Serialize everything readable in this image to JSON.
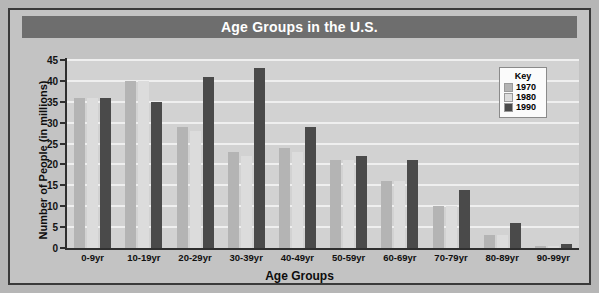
{
  "chart_data": {
    "type": "bar",
    "title": "Age Groups in the U.S.",
    "xlabel": "Age Groups",
    "ylabel": "Number of People (in millions)",
    "categories": [
      "0-9yr",
      "10-19yr",
      "20-29yr",
      "30-39yr",
      "40-49yr",
      "50-59yr",
      "60-69yr",
      "70-79yr",
      "80-89yr",
      "90-99yr"
    ],
    "series": [
      {
        "name": "1970",
        "color": "#b4b4b4",
        "values": [
          36,
          40,
          29,
          23,
          24,
          21,
          16,
          10,
          3,
          0.4
        ]
      },
      {
        "name": "1980",
        "color": "#dcdcdc",
        "values": [
          36,
          40,
          28,
          22,
          23,
          21,
          16,
          10,
          3,
          0.4
        ]
      },
      {
        "name": "1990",
        "color": "#4a4a4a",
        "values": [
          36,
          35,
          41,
          43,
          29,
          22,
          21,
          14,
          6,
          1
        ]
      }
    ],
    "ylim": [
      0,
      45
    ],
    "yticks": [
      0,
      5,
      10,
      15,
      20,
      25,
      30,
      35,
      40,
      45
    ],
    "grid": true,
    "legend": {
      "title": "Key",
      "position": "top-right"
    }
  },
  "legend": {
    "title": "Key",
    "entries": [
      {
        "label": "1970",
        "color": "#b4b4b4"
      },
      {
        "label": "1980",
        "color": "#dcdcdc"
      },
      {
        "label": "1990",
        "color": "#4a4a4a"
      }
    ]
  },
  "colors": {
    "title_bar": "#6e6e6e",
    "title_text": "#ffffff",
    "plot_background": "#d2d2d2",
    "frame_background": "#c3c3c3",
    "gridline": "#efefef",
    "axis": "#2f2f2f"
  }
}
